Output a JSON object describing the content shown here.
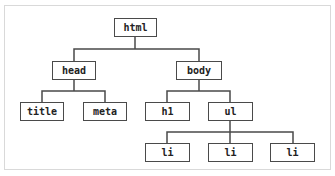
{
  "diagram": {
    "type": "tree",
    "title_partial": "",
    "nodes": {
      "html": {
        "label": "html"
      },
      "head": {
        "label": "head"
      },
      "body": {
        "label": "body"
      },
      "title": {
        "label": "title"
      },
      "meta": {
        "label": "meta"
      },
      "h1": {
        "label": "h1"
      },
      "ul": {
        "label": "ul"
      },
      "li1": {
        "label": "li"
      },
      "li2": {
        "label": "li"
      },
      "li3": {
        "label": "li"
      }
    },
    "edges": [
      [
        "html",
        "head"
      ],
      [
        "html",
        "body"
      ],
      [
        "head",
        "title"
      ],
      [
        "head",
        "meta"
      ],
      [
        "body",
        "h1"
      ],
      [
        "body",
        "ul"
      ],
      [
        "ul",
        "li1"
      ],
      [
        "ul",
        "li2"
      ],
      [
        "ul",
        "li3"
      ]
    ],
    "colors": {
      "node_border": "#4a4a4a",
      "edge": "#4a4a4a",
      "frame_border": "#d9d9d9"
    }
  }
}
